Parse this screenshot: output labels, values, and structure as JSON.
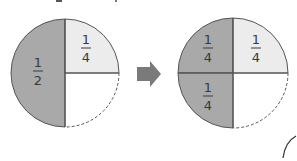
{
  "diagram": {
    "colors": {
      "dark_shade": "#a9a9a9",
      "light_shade": "#ececec",
      "empty": "#ffffff",
      "outline": "#555555",
      "arrow": "#7a7a7a",
      "text": "#3a3a3a"
    },
    "left_circle": {
      "segments": [
        {
          "region": "left-half",
          "fraction_num": "1",
          "fraction_den": "2",
          "shade": "dark"
        },
        {
          "region": "top-right-quarter",
          "fraction_num": "1",
          "fraction_den": "4",
          "shade": "light"
        },
        {
          "region": "bottom-right-quarter",
          "fraction_num": "",
          "fraction_den": "",
          "shade": "none",
          "border": "dashed"
        }
      ]
    },
    "arrow": {
      "direction": "right"
    },
    "right_circle": {
      "segments": [
        {
          "region": "top-left-quarter",
          "fraction_num": "1",
          "fraction_den": "4",
          "shade": "dark"
        },
        {
          "region": "top-right-quarter",
          "fraction_num": "1",
          "fraction_den": "4",
          "shade": "light"
        },
        {
          "region": "bottom-left-quarter",
          "fraction_num": "1",
          "fraction_den": "4",
          "shade": "dark"
        },
        {
          "region": "bottom-right-quarter",
          "fraction_num": "",
          "fraction_den": "",
          "shade": "none",
          "border": "dashed"
        }
      ]
    }
  }
}
